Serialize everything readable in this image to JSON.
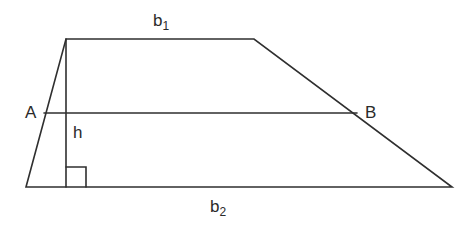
{
  "diagram": {
    "colors": {
      "stroke": "#2f2f2f",
      "text": "#2a2a2a",
      "background": "#ffffff"
    },
    "labels": {
      "b1_main": "b",
      "b1_sub": "1",
      "b2_main": "b",
      "b2_sub": "2",
      "A": "A",
      "B": "B",
      "h": "h"
    },
    "vertices": {
      "top_left": [
        66,
        39
      ],
      "top_right": [
        254,
        39
      ],
      "bottom_right": [
        452,
        187
      ],
      "bottom_left": [
        26,
        187
      ]
    },
    "midsegment": {
      "from": "A",
      "to": "B",
      "A": [
        44,
        113
      ],
      "B": [
        357,
        113
      ]
    },
    "height_line": {
      "x": 66,
      "y1": 39,
      "y2": 187
    },
    "right_angle_marker": {
      "x": 66,
      "y": 167,
      "size": 20
    }
  }
}
